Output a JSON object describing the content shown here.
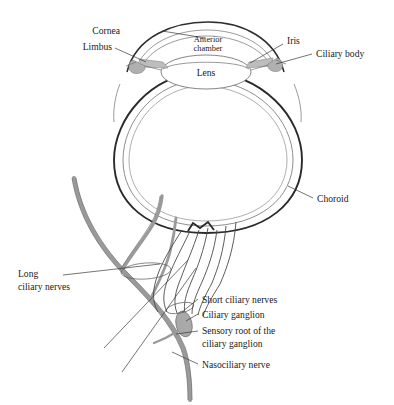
{
  "figure": {
    "background_color": "#ffffff",
    "ink_color": "#1a1a1a",
    "shading_color": "#b4b4b4"
  },
  "labels": {
    "cornea": "Cornea",
    "limbus": "Limbus",
    "anterior_chamber_line1": "Anterior",
    "anterior_chamber_line2": "chamber",
    "lens": "Lens",
    "iris": "Iris",
    "ciliary_body": "Ciliary body",
    "choroid": "Choroid",
    "long_ciliary_line1": "Long",
    "long_ciliary_line2": "ciliary nerves",
    "short_ciliary_nerves": "Short ciliary nerves",
    "ciliary_ganglion": "Ciliary ganglion",
    "sensory_root_line1": "Sensory root of the",
    "sensory_root_line2": "ciliary ganglion",
    "nasociliary_nerve": "Nasociliary nerve"
  }
}
